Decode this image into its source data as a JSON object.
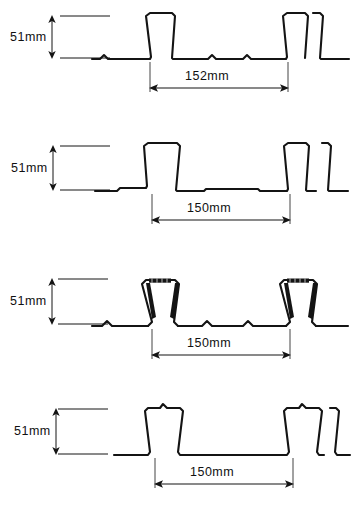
{
  "figure": {
    "background_color": "#ffffff",
    "line_color": "#141414",
    "units": "mm"
  },
  "profiles": [
    {
      "id": "profile-1",
      "name": "trapezoidal-deck-with-flange-stiffeners",
      "height_label": "51mm",
      "width_label": "152mm",
      "height_value": 51,
      "width_value": 152,
      "rib_type": "trapezoidal",
      "features": "wide trapezoidal ribs, small triangular stiffener bumps in bottom flange"
    },
    {
      "id": "profile-2",
      "name": "trapezoidal-deck-plain",
      "height_label": "51mm",
      "width_label": "150mm",
      "height_value": 51,
      "width_value": 150,
      "rib_type": "trapezoidal",
      "features": "narrow trapezoidal ribs, plain flat bottom flange with step"
    },
    {
      "id": "profile-3",
      "name": "re-entrant-dovetail-deck",
      "height_label": "51mm",
      "width_label": "150mm",
      "height_value": 51,
      "width_value": 150,
      "rib_type": "re-entrant dovetail",
      "features": "dovetail ribs with thick dark tapered webs, hatched embossed top, bottom flange stiffener bumps"
    },
    {
      "id": "profile-4",
      "name": "trapezoidal-deck-with-crown-notch",
      "height_label": "51mm",
      "width_label": "150mm",
      "height_value": 51,
      "width_value": 150,
      "rib_type": "trapezoidal",
      "features": "narrow trapezoidal ribs with small notch bump at crown centre"
    }
  ]
}
